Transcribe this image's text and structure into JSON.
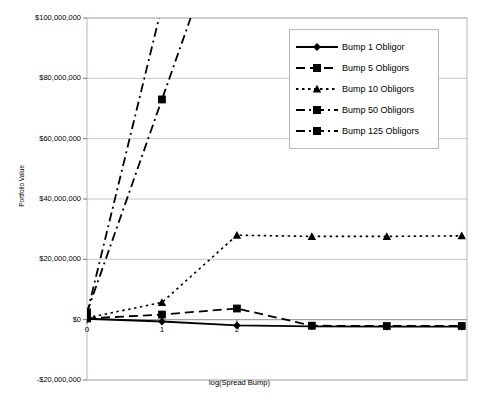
{
  "chart_data": {
    "type": "line",
    "title": "",
    "xlabel": "log(Spread Bump)",
    "ylabel": "Portfolio Value",
    "xlim": [
      0,
      5.07
    ],
    "ylim": [
      -20000000,
      100000000
    ],
    "grid": true,
    "legend_position": "top-right",
    "x_ticks": [
      "0",
      "1",
      "2"
    ],
    "x_tick_values": [
      0,
      1,
      2
    ],
    "y_ticks": [
      "-$20,000,000",
      "$0",
      "$20,000,000",
      "$40,000,000",
      "$60,000,000",
      "$80,000,000",
      "$100,000,000"
    ],
    "y_tick_values": [
      -20000000,
      0,
      20000000,
      40000000,
      60000000,
      80000000,
      100000000
    ],
    "x": [
      0,
      1,
      2,
      3,
      4,
      5
    ],
    "series": [
      {
        "name": "Bump 1 Obligor",
        "marker": "diamond",
        "dash": "solid",
        "values": [
          300000,
          -600000,
          -1900000,
          -2200000,
          -2300000,
          -2300000
        ]
      },
      {
        "name": "Bump 5 Obligors",
        "marker": "square",
        "dash": "dashed",
        "values": [
          400000,
          1700000,
          3700000,
          -2000000,
          -2100000,
          -2100000
        ]
      },
      {
        "name": "Bump 10 Obligors",
        "marker": "triangle",
        "dash": "dotted",
        "values": [
          600000,
          5700000,
          28000000,
          27600000,
          27600000,
          27800000
        ]
      },
      {
        "name": "Bump 50 Obligors",
        "marker": "square",
        "dash": "dashdot",
        "values": [
          2000000,
          104000000,
          null,
          null,
          null,
          null
        ]
      },
      {
        "name": "Bump 125 Obligors",
        "marker": "square",
        "dash": "dashdot",
        "values": [
          2400000,
          73000000,
          null,
          null,
          null,
          null
        ]
      }
    ]
  },
  "legend": {
    "items": [
      {
        "label": "Bump 1 Obligor",
        "marker": "diamond",
        "dash": "solid"
      },
      {
        "label": "Bump 5 Obligors",
        "marker": "square",
        "dash": "dashed"
      },
      {
        "label": "Bump 10 Obligors",
        "marker": "triangle",
        "dash": "dotted"
      },
      {
        "label": "Bump 50 Obligors",
        "marker": "square",
        "dash": "dashdot"
      },
      {
        "label": "Bump 125 Obligors",
        "marker": "square",
        "dash": "dashdot"
      }
    ]
  },
  "colors": {
    "series": "#000000",
    "grid": "#c8c8c8",
    "frame": "#b9b9b9",
    "background": "#ffffff"
  }
}
